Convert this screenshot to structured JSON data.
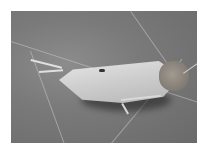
{
  "image": {
    "subject": "insect (planthopper) resting on a leaf",
    "style": "grayscale photograph",
    "colors": {
      "background_leaf": "#7a7a7a",
      "insect_wings": "#d4d4d4",
      "insect_head": "#857f78",
      "border": "#ffffff"
    }
  }
}
